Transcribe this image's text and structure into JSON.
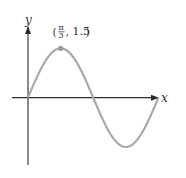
{
  "chart_data": {
    "type": "line",
    "title": "",
    "function": "y = 1.5 sin(1.5x)",
    "xlabel": "x",
    "ylabel": "y",
    "xlim": [
      -0.9,
      4.4
    ],
    "ylim": [
      -2.2,
      2.3
    ],
    "grid": false,
    "legend": "none",
    "series": [
      {
        "name": "curve",
        "color": "#a9a9a9",
        "x_start": 0,
        "x_end": 4.18879,
        "amplitude": 1.5,
        "angular_frequency": 1.5
      }
    ],
    "annotations": [
      {
        "x": 1.0472,
        "y": 1.5,
        "label_prefix": "(",
        "label_num": "π",
        "label_den": "3",
        "label_suffix": ", 1.5)"
      }
    ]
  }
}
